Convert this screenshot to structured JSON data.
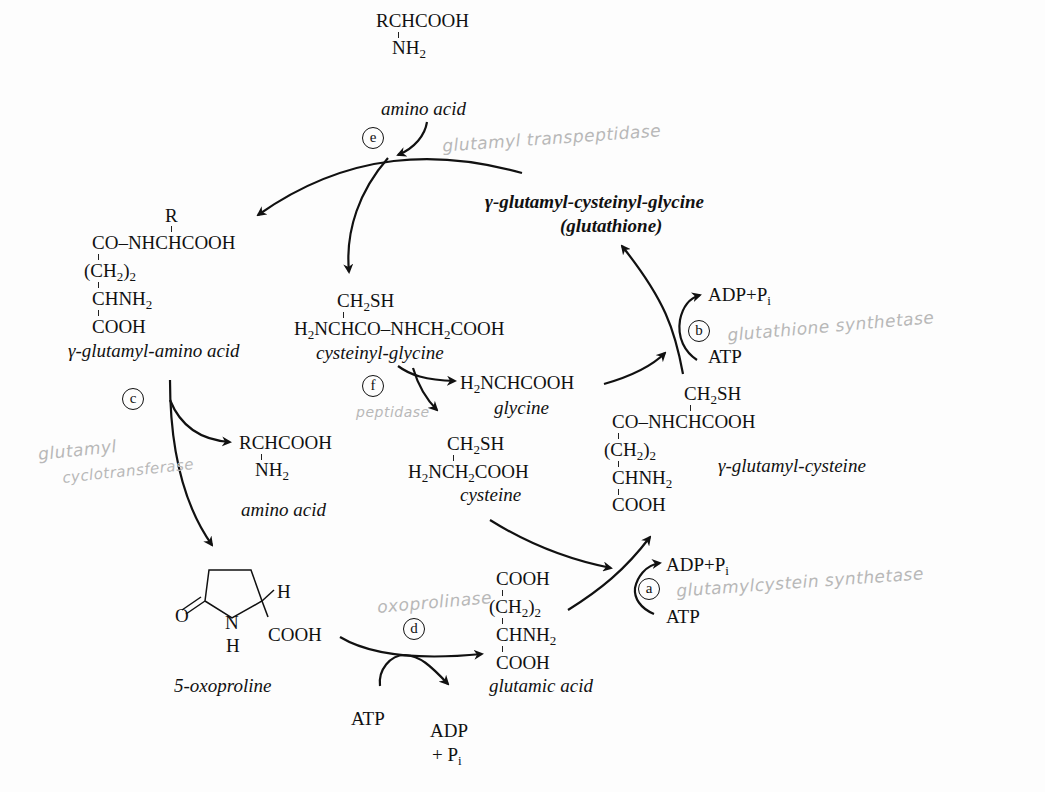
{
  "diagram": {
    "nodes": {
      "amino_acid_top": {
        "formula": "RCHCOOH",
        "sub": "NH",
        "sub_n": "2",
        "label": "amino acid"
      },
      "glutathione": {
        "label": "γ-glutamyl-cysteinyl-glycine",
        "label2": "(glutathione)"
      },
      "gamma_glutamyl_amino_acid": {
        "r": "R",
        "line1": "CO–NHCHCOOH",
        "line2a": "(CH",
        "line2b": "2",
        "line2c": ")",
        "line2d": "2",
        "line3a": "CHNH",
        "line3b": "2",
        "line4": "COOH",
        "label": "γ-glutamyl-amino acid"
      },
      "cysteinyl_glycine": {
        "top_a": "CH",
        "top_b": "2",
        "top_c": "SH",
        "main_a": "H",
        "main_b": "2",
        "main_c": "NCHCO–NHCH",
        "main_d": "2",
        "main_e": "COOH",
        "label": "cysteinyl-glycine"
      },
      "glycine": {
        "a": "H",
        "b": "2",
        "c": "NCHCOOH",
        "label": "glycine"
      },
      "cysteine": {
        "top_a": "CH",
        "top_b": "2",
        "top_c": "SH",
        "main_a": "H",
        "main_b": "2",
        "main_c": "NCH",
        "main_d": "2",
        "main_e": "COOH",
        "label": "cysteine"
      },
      "amino_acid_mid": {
        "formula": "RCHCOOH",
        "sub": "NH",
        "sub_n": "2",
        "label": "amino acid"
      },
      "gamma_glutamyl_cysteine": {
        "top_a": "CH",
        "top_b": "2",
        "top_c": "SH",
        "line1": "CO–NHCHCOOH",
        "line2a": "(CH",
        "line2b": "2",
        "line2c": ")",
        "line2d": "2",
        "line3a": "CHNH",
        "line3b": "2",
        "line4": "COOH",
        "label": "γ-glutamyl-cysteine"
      },
      "oxoproline": {
        "o": "O",
        "n": "N",
        "h_n": "H",
        "h": "H",
        "cooh": "COOH",
        "label": "5-oxoproline"
      },
      "glutamic_acid": {
        "line1": "COOH",
        "line2a": "(CH",
        "line2b": "2",
        "line2c": ")",
        "line2d": "2",
        "line3a": "CHNH",
        "line3b": "2",
        "line4": "COOH",
        "label": "glutamic acid"
      }
    },
    "cofactors": {
      "b_adp": "ADP+P",
      "b_adp_i": "i",
      "b_atp": "ATP",
      "a_adp": "ADP+P",
      "a_adp_i": "i",
      "a_atp": "ATP",
      "d_atp": "ATP",
      "d_adp": "ADP",
      "d_pi": "+ P",
      "d_pi_i": "i"
    },
    "step_labels": [
      "a",
      "b",
      "c",
      "d",
      "e",
      "f"
    ],
    "handwritten": {
      "e": "glutamyl transpeptidase",
      "b": "glutathione synthetase",
      "c1": "glutamyl",
      "c2": "cyclotransferase",
      "f": "peptidase",
      "d": "oxoprolinase",
      "a": "glutamylcystein synthetase"
    }
  }
}
